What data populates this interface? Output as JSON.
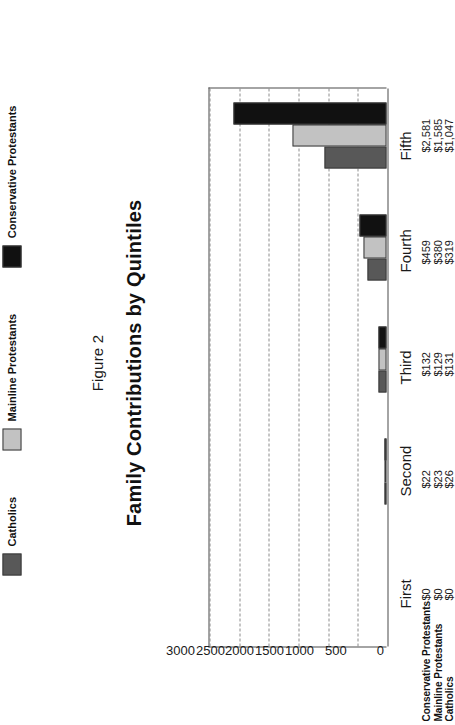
{
  "figure": {
    "number_label": "Figure 2",
    "title": "Family Contributions by Quintiles"
  },
  "axis": {
    "ticks": [
      "3000",
      "2500",
      "2000",
      "1500",
      "1000",
      "500",
      "0"
    ],
    "min": 0,
    "max": 3000
  },
  "row_names": {
    "r0": "Conservative Protestants",
    "r1": "Mainline Protestants",
    "r2": "Catholics"
  },
  "legend": {
    "items": [
      {
        "label": "Catholics",
        "color": "#585858"
      },
      {
        "label": "Mainline Protestants",
        "color": "#c2c2c2"
      },
      {
        "label": "Conservative Protestants",
        "color": "#111111"
      }
    ]
  },
  "categories": {
    "c0": "First",
    "c1": "Second",
    "c2": "Third",
    "c3": "Fourth",
    "c4": "Fifth"
  },
  "value_labels": {
    "first": {
      "cp": "$0",
      "mp": "$0",
      "cath": "$0"
    },
    "second": {
      "cp": "$22",
      "mp": "$23",
      "cath": "$26"
    },
    "third": {
      "cp": "$132",
      "mp": "$129",
      "cath": "$131"
    },
    "fourth": {
      "cp": "$459",
      "mp": "$380",
      "cath": "$319"
    },
    "fifth": {
      "cp": "$2,581",
      "mp": "$1,585",
      "cath": "$1,047"
    }
  },
  "chart_data": {
    "type": "bar",
    "orientation": "horizontal-rotated",
    "title": "Family Contributions by Quintiles",
    "subtitle": "Figure 2",
    "xlabel": "",
    "ylabel": "",
    "categories": [
      "First",
      "Second",
      "Third",
      "Fourth",
      "Fifth"
    ],
    "series": [
      {
        "name": "Conservative Protestants",
        "color": "#111111",
        "values": [
          0,
          22,
          132,
          459,
          2581
        ]
      },
      {
        "name": "Mainline Protestants",
        "color": "#c2c2c2",
        "values": [
          0,
          23,
          129,
          380,
          1585
        ]
      },
      {
        "name": "Catholics",
        "color": "#585858",
        "values": [
          0,
          26,
          131,
          319,
          1047
        ]
      }
    ],
    "value_axis_ticks": [
      0,
      500,
      1000,
      1500,
      2000,
      2500,
      3000
    ],
    "ylim": [
      0,
      3000
    ],
    "grid": true,
    "grid_style": "dashed",
    "legend_position": "bottom"
  }
}
